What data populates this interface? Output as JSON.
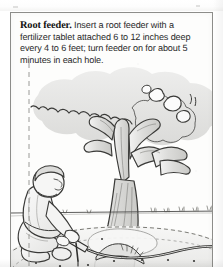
{
  "figure": {
    "caption": {
      "lead_label": "Root feeder.",
      "body_text": " Insert a root feeder with a fertilizer tablet attached 6 to 12 inches deep every 4 to 6 feet; turn feeder on for about 5 minutes in each hole."
    },
    "illustration": {
      "alt_label": "Line drawing of a kneeling gardener inserting a root feeder probe into the soil beneath a broad deciduous tree, with a garden hose connected to the feeder",
      "elements": [
        "dashed-drip-line",
        "tree-canopy",
        "tree-trunk",
        "tree-root-flare",
        "horizon-line",
        "mulch-ring",
        "kneeling-person",
        "root-feeder-probe",
        "garden-hose",
        "soil-hole-markers",
        "background-grass-tufts"
      ],
      "hole_marker_count": 9,
      "style": "pen-and-ink line art, grayscale halftone shading"
    },
    "colors": {
      "page_background": "#ffffff",
      "box_fill": "#fdfdfc",
      "box_border": "#8d8d8a",
      "ink": "#2b2b2b",
      "line_art": "#3a3a38",
      "canopy_fill": "#e3e3e1",
      "trunk_fill": "#dedede",
      "ground_fill": "#efefee",
      "mulch_fill": "#e6e6e4",
      "person_fill": "#f2f2f1",
      "dash_line": "#9a9a97"
    }
  }
}
